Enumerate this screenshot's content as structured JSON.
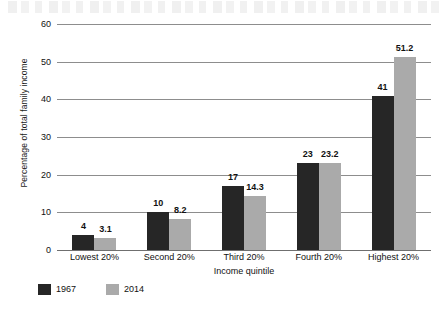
{
  "chart_data": {
    "type": "bar",
    "title": "",
    "xlabel": "Income quintile",
    "ylabel": "Percentage of total family income",
    "categories": [
      "Lowest 20%",
      "Second 20%",
      "Third 20%",
      "Fourth 20%",
      "Highest 20%"
    ],
    "series": [
      {
        "name": "1967",
        "color": "#262626",
        "values": [
          4,
          10,
          17,
          23,
          41
        ],
        "labels": [
          "4",
          "10",
          "17",
          "23",
          "41"
        ]
      },
      {
        "name": "2014",
        "color": "#aaaaaa",
        "values": [
          3.1,
          8.2,
          14.3,
          23.2,
          51.2
        ],
        "labels": [
          "3.1",
          "8.2",
          "14.3",
          "23.2",
          "51.2"
        ]
      }
    ],
    "ylim": [
      0,
      60
    ],
    "yticks": [
      0,
      10,
      20,
      30,
      40,
      50,
      60
    ],
    "ytick_labels": [
      "0",
      "10",
      "20",
      "30",
      "40",
      "50",
      "60"
    ],
    "grid": true,
    "legend_position": "bottom-left"
  },
  "legend": {
    "items": [
      {
        "label": "1967",
        "color": "#262626"
      },
      {
        "label": "2014",
        "color": "#aaaaaa"
      }
    ]
  }
}
